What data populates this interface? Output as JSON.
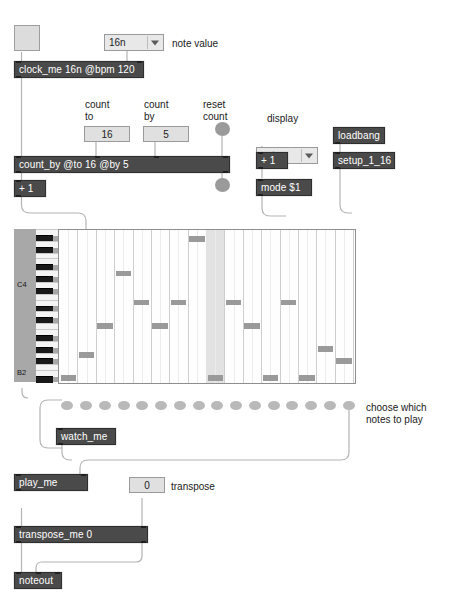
{
  "patch": {
    "title": "sequencer patch",
    "objects": {
      "clock": "clock_me 16n @bpm 120",
      "count_by": "count_by @to 16 @by 5",
      "plus_one_left": "+ 1",
      "plus_one_display": "+ 1",
      "mode_msg": "mode $1",
      "loadbang": "loadbang",
      "setup": "setup_1_16",
      "watch_me": "watch_me",
      "play_me": "play_me",
      "transpose_me": "transpose_me 0",
      "noteout": "noteout"
    },
    "values": {
      "note_value_menu": "16n",
      "count_to": "16",
      "count_by": "5",
      "display_menu": "note",
      "transpose": "0"
    },
    "comments": {
      "note_value": "note value",
      "count_to": "count\nto",
      "count_by": "count\nby",
      "reset_count": "reset\ncount",
      "display": "display",
      "choose_notes": "choose which\nnotes to play",
      "transpose": "transpose"
    },
    "keyboard": {
      "label_high": "C4",
      "label_low": "B2"
    },
    "colors": {
      "object_fill": "#4a4a4a",
      "object_text": "#ffffff",
      "numbox_fill": "#e0e0e0",
      "cord": "#b4b4b4",
      "note_fill": "#9a9a9a",
      "dot_fill": "#b9b9b9",
      "keys_bg": "#a8a8a8",
      "highlight_column": "#e2e2e2"
    },
    "grid": {
      "columns": 16,
      "rows": 26,
      "highlight_column_index": 8,
      "notes": [
        {
          "col": 0,
          "row": 25
        },
        {
          "col": 1,
          "row": 21
        },
        {
          "col": 2,
          "row": 16
        },
        {
          "col": 3,
          "row": 7
        },
        {
          "col": 4,
          "row": 12
        },
        {
          "col": 5,
          "row": 16
        },
        {
          "col": 6,
          "row": 12
        },
        {
          "col": 7,
          "row": 1
        },
        {
          "col": 8,
          "row": 25
        },
        {
          "col": 9,
          "row": 12
        },
        {
          "col": 10,
          "row": 16
        },
        {
          "col": 11,
          "row": 25
        },
        {
          "col": 12,
          "row": 12
        },
        {
          "col": 13,
          "row": 25
        },
        {
          "col": 14,
          "row": 20
        },
        {
          "col": 15,
          "row": 22
        }
      ],
      "key_pattern": [
        0,
        1,
        0,
        1,
        0,
        0,
        1,
        0,
        1,
        0,
        1,
        0,
        0,
        1,
        0,
        1,
        0,
        0,
        1,
        0,
        1,
        0,
        1,
        0,
        0,
        1
      ]
    },
    "dots": {
      "count": 16
    }
  }
}
